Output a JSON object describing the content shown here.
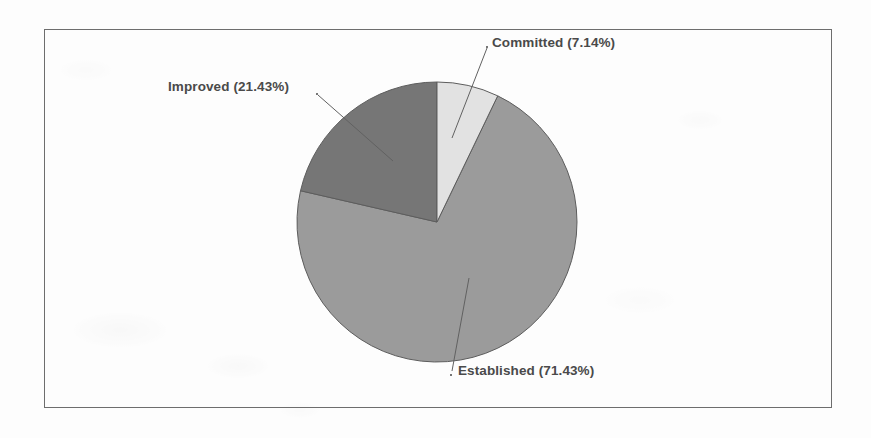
{
  "figure": {
    "background_color": "#fdfdfd",
    "frame_color": "#6d6d6d",
    "label_color": "#4a4a4a"
  },
  "chart_data": {
    "type": "pie",
    "title": "",
    "subtitle": "",
    "xlabel": "",
    "ylabel": "",
    "grid": false,
    "legend_position": "none",
    "label_style": "outside-with-leader-lines",
    "start_angle_deg": 0,
    "direction": "clockwise",
    "total_percent": 100.0,
    "categories": [
      "Committed",
      "Established",
      "Improved"
    ],
    "values": [
      7.14,
      71.43,
      21.43
    ],
    "slices": [
      {
        "label": "Committed (7.14%)",
        "name": "Committed",
        "percent": 7.14,
        "color": "#e2e2e2",
        "edge_color": "#5d5d5d",
        "start_angle_deg": 0.0,
        "end_angle_deg": 25.7
      },
      {
        "label": "Established (71.43%)",
        "name": "Established",
        "percent": 71.43,
        "color": "#9b9b9b",
        "edge_color": "#5d5d5d",
        "start_angle_deg": 25.7,
        "end_angle_deg": 282.9
      },
      {
        "label": "Improved (21.43%)",
        "name": "Improved",
        "percent": 21.43,
        "color": "#767676",
        "edge_color": "#5d5d5d",
        "start_angle_deg": 282.9,
        "end_angle_deg": 360.0
      }
    ]
  },
  "labels": {
    "committed": "Committed (7.14%)",
    "established": "Established (71.43%)",
    "improved": "Improved (21.43%)"
  }
}
